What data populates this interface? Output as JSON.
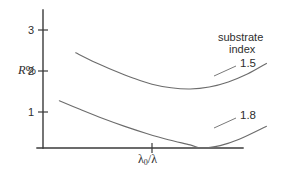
{
  "chart_data": {
    "type": "line",
    "title": "",
    "xlabel": "λ₀/λ",
    "ylabel": "R%",
    "ylim": [
      0,
      3.4
    ],
    "xlim": [
      0.6,
      1.45
    ],
    "yticks": [
      "1",
      "2",
      "3"
    ],
    "ytick_values": [
      1,
      2,
      3
    ],
    "xticks": [
      "λ₀/λ"
    ],
    "grid": false,
    "legend_position": "right",
    "legend_title_line1": "substrate",
    "legend_title_line2": "index",
    "series": [
      {
        "name": "1.5",
        "label": "1.5",
        "color": "#6c6c6c",
        "minimum_value": 1.5,
        "points": [
          {
            "x": 0.72,
            "y": 2.42
          },
          {
            "x": 0.79,
            "y": 2.18
          },
          {
            "x": 0.86,
            "y": 1.97
          },
          {
            "x": 0.93,
            "y": 1.78
          },
          {
            "x": 1.0,
            "y": 1.62
          },
          {
            "x": 1.07,
            "y": 1.53
          },
          {
            "x": 1.14,
            "y": 1.5
          },
          {
            "x": 1.21,
            "y": 1.55
          },
          {
            "x": 1.28,
            "y": 1.68
          },
          {
            "x": 1.35,
            "y": 1.88
          },
          {
            "x": 1.42,
            "y": 2.15
          }
        ]
      },
      {
        "name": "1.8",
        "label": "1.8",
        "color": "#6c6c6c",
        "minimum_value": 0.0,
        "points": [
          {
            "x": 0.66,
            "y": 1.2
          },
          {
            "x": 0.74,
            "y": 0.97
          },
          {
            "x": 0.82,
            "y": 0.75
          },
          {
            "x": 0.9,
            "y": 0.55
          },
          {
            "x": 0.98,
            "y": 0.37
          },
          {
            "x": 1.06,
            "y": 0.21
          },
          {
            "x": 1.14,
            "y": 0.08
          },
          {
            "x": 1.18,
            "y": 0.0
          },
          {
            "x": 1.25,
            "y": 0.06
          },
          {
            "x": 1.32,
            "y": 0.22
          },
          {
            "x": 1.42,
            "y": 0.55
          }
        ]
      }
    ]
  },
  "axes": {
    "y_title_main": "R",
    "y_title_unit": "%",
    "y_tick_1": "1",
    "y_tick_2": "2",
    "y_tick_3": "3",
    "x_title_lambda": "λ",
    "x_title_sub": "0",
    "x_title_rest": "/λ"
  },
  "legend": {
    "line1": "substrate",
    "line2": "index",
    "series_1_label": "1.5",
    "series_2_label": "1.8"
  }
}
